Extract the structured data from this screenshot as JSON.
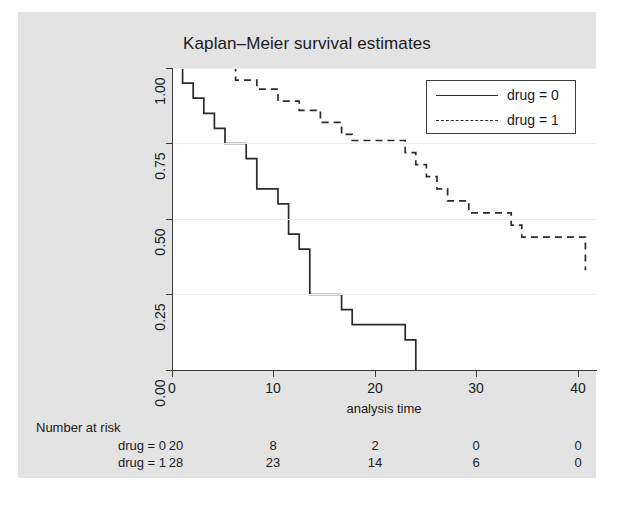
{
  "chart_data": {
    "type": "line",
    "title": "Kaplan–Meier survival estimates",
    "xlabel": "analysis time",
    "ylabel": "",
    "xlim": [
      0,
      40
    ],
    "ylim": [
      0,
      1
    ],
    "xticks": [
      "0",
      "10",
      "20",
      "30",
      "40"
    ],
    "xtick_values": [
      0,
      10,
      20,
      30,
      40
    ],
    "yticks": [
      "0.00",
      "0.25",
      "0.50",
      "0.75",
      "1.00"
    ],
    "ytick_values": [
      0.0,
      0.25,
      0.5,
      0.75,
      1.0
    ],
    "grid": true,
    "legend_position": "top-right",
    "step_shape": "post",
    "series": [
      {
        "name": "drug = 0",
        "style": "solid",
        "color": "#2b2b2b",
        "x": [
          0,
          1,
          2,
          3,
          4,
          5,
          7,
          8,
          10,
          11,
          12,
          13,
          16,
          17,
          22,
          23
        ],
        "y": [
          1.0,
          0.95,
          0.9,
          0.85,
          0.8,
          0.75,
          0.7,
          0.6,
          0.55,
          0.45,
          0.4,
          0.25,
          0.2,
          0.15,
          0.1,
          0.0
        ]
      },
      {
        "name": "drug = 1",
        "style": "dashed",
        "color": "#2b2b2b",
        "x": [
          0,
          6,
          8,
          10,
          12,
          14,
          16,
          17,
          22,
          23,
          24,
          25,
          26,
          28,
          32,
          33,
          39
        ],
        "y": [
          1.0,
          0.96,
          0.93,
          0.89,
          0.86,
          0.82,
          0.78,
          0.76,
          0.72,
          0.68,
          0.64,
          0.6,
          0.56,
          0.52,
          0.48,
          0.44,
          0.33
        ]
      }
    ]
  },
  "legend": {
    "entries": [
      {
        "label": "drug = 0",
        "style": "solid"
      },
      {
        "label": "drug = 1",
        "style": "dashed"
      }
    ]
  },
  "risk_table": {
    "title": "Number at risk",
    "time_points": [
      0,
      10,
      20,
      30,
      40
    ],
    "rows": [
      {
        "label": "drug = 0",
        "counts": [
          "20",
          "8",
          "2",
          "0",
          "0"
        ]
      },
      {
        "label": "drug = 1",
        "counts": [
          "28",
          "23",
          "14",
          "6",
          "0"
        ]
      }
    ]
  }
}
